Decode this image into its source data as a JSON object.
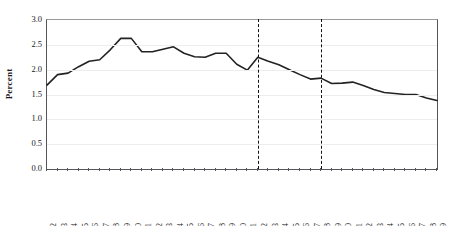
{
  "chart_data": {
    "type": "line",
    "title": "",
    "xlabel": "",
    "ylabel": "Percent",
    "ylim": [
      0.0,
      3.0
    ],
    "ytick_labels": [
      "0.0",
      "0.5",
      "1.0",
      "1.5",
      "2.0",
      "2.5",
      "3.0"
    ],
    "ytick_values": [
      0.0,
      0.5,
      1.0,
      1.5,
      2.0,
      2.5,
      3.0
    ],
    "grid": true,
    "grid_axis": "y",
    "legend": "none",
    "line_color": "#222222",
    "categories": [
      "1982",
      "1983",
      "1984",
      "1985",
      "1986",
      "1987",
      "1988",
      "1989",
      "1990",
      "1991",
      "1992",
      "1993",
      "1994",
      "1995",
      "1996",
      "1997",
      "1998",
      "1999",
      "2000",
      "2001",
      "2002",
      "2003",
      "2004",
      "2005",
      "2006",
      "2007",
      "2008",
      "2009",
      "2010",
      "2011",
      "2012",
      "2013",
      "2014",
      "2015",
      "2016",
      "2017",
      "2018",
      "2019"
    ],
    "values": [
      1.69,
      1.9,
      1.93,
      2.06,
      2.17,
      2.2,
      2.4,
      2.63,
      2.63,
      2.36,
      2.36,
      2.41,
      2.46,
      2.33,
      2.26,
      2.25,
      2.33,
      2.33,
      2.11,
      1.99,
      2.25,
      2.17,
      2.1,
      2.0,
      1.9,
      1.81,
      1.83,
      1.72,
      1.73,
      1.75,
      1.68,
      1.6,
      1.54,
      1.52,
      1.5,
      1.5,
      1.43,
      1.38
    ],
    "annotations": [
      {
        "type": "vertical-dashed-line",
        "x": "2002",
        "label": ""
      },
      {
        "type": "vertical-dashed-line",
        "x": "2008",
        "label": ""
      }
    ]
  }
}
